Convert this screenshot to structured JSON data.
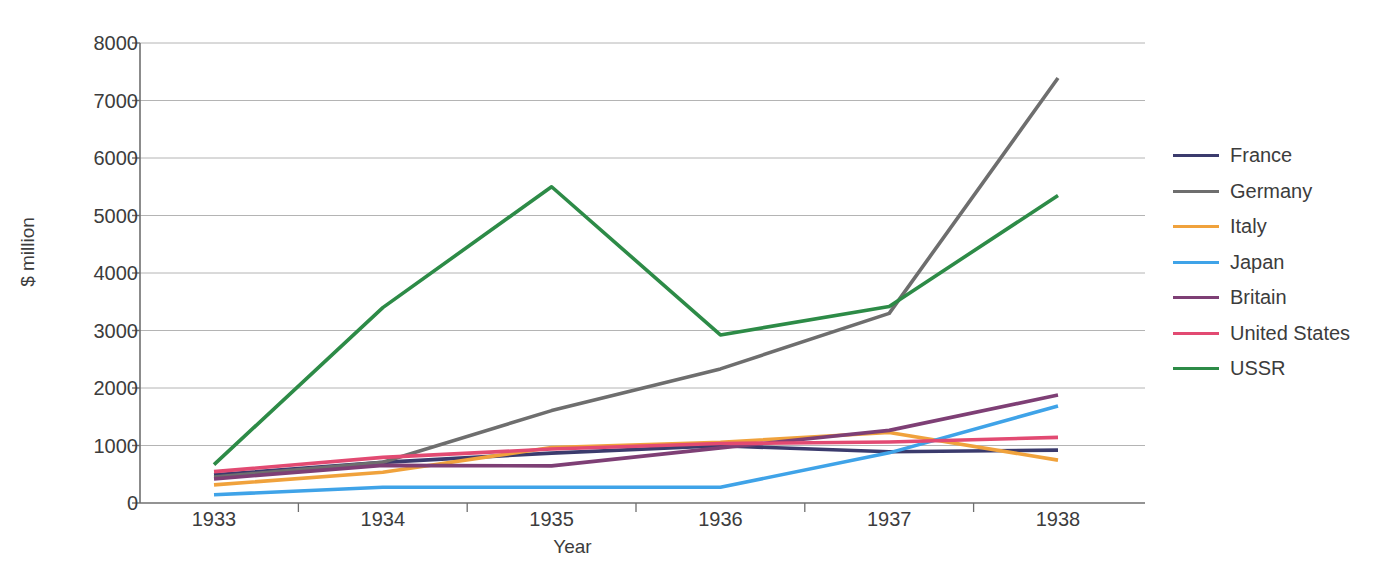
{
  "chart_data": {
    "type": "line",
    "title": "",
    "xlabel": "Year",
    "ylabel": "$ million",
    "categories": [
      "1933",
      "1934",
      "1935",
      "1936",
      "1937",
      "1938"
    ],
    "x": [
      1933,
      1934,
      1935,
      1936,
      1937,
      1938
    ],
    "ylim": [
      0,
      8000
    ],
    "yticks": [
      0,
      1000,
      2000,
      3000,
      4000,
      5000,
      6000,
      7000,
      8000
    ],
    "ytick_labels": [
      "0",
      "1000",
      "2000",
      "3000",
      "4000",
      "5000",
      "6000",
      "7000",
      "8000"
    ],
    "grid": "horizontal",
    "legend_position": "right",
    "series": [
      {
        "name": "France",
        "color": "#3b3b6d",
        "values": [
          490,
          707,
          867,
          995,
          890,
          919
        ]
      },
      {
        "name": "Germany",
        "color": "#6e6e6e",
        "values": [
          452,
          709,
          1607,
          2332,
          3298,
          7391
        ]
      },
      {
        "name": "Italy",
        "color": "#f0a23c",
        "values": [
          316,
          535,
          966,
          1057,
          1227,
          746
        ]
      },
      {
        "name": "Japan",
        "color": "#3fa3e8",
        "values": [
          144,
          275,
          274,
          275,
          872,
          1687
        ]
      },
      {
        "name": "Britain",
        "color": "#7e3f75",
        "values": [
          420,
          654,
          645,
          959,
          1263,
          1878
        ]
      },
      {
        "name": "United States",
        "color": "#e24a72",
        "values": [
          545,
          793,
          938,
          1034,
          1060,
          1141
        ]
      },
      {
        "name": "USSR",
        "color": "#2d8b47",
        "values": [
          667,
          3398,
          5500,
          2923,
          3418,
          5349
        ]
      }
    ]
  },
  "axis": {
    "ylabel_text": "$ million",
    "xlabel_text": "Year"
  },
  "legend": {
    "items": [
      {
        "label": "France",
        "color": "#3b3b6d"
      },
      {
        "label": "Germany",
        "color": "#6e6e6e"
      },
      {
        "label": "Italy",
        "color": "#f0a23c"
      },
      {
        "label": "Japan",
        "color": "#3fa3e8"
      },
      {
        "label": "Britain",
        "color": "#7e3f75"
      },
      {
        "label": "United States",
        "color": "#e24a72"
      },
      {
        "label": "USSR",
        "color": "#2d8b47"
      }
    ]
  },
  "style": {
    "axis_color": "#6f6f6f",
    "grid_color": "#b4b4b4",
    "text_color": "#3c3c3c",
    "background": "#ffffff"
  }
}
